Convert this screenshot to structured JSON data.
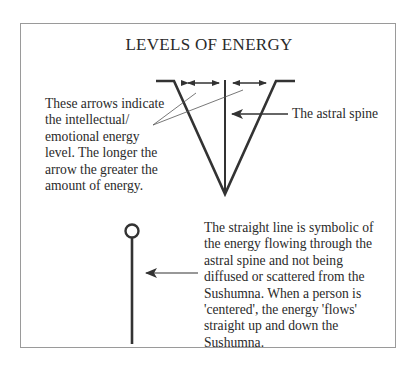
{
  "title": "LEVELS OF ENERGY",
  "annotations": {
    "arrows_note": [
      "These arrows indicate",
      "the intellectual/",
      "emotional energy",
      "level. The longer the",
      "arrow the greater the",
      "amount of energy."
    ],
    "spine_label": "The astral spine",
    "straight_line_note": [
      "The straight line is symbolic of",
      "the energy flowing through the",
      "astral spine and not being",
      "diffused or scattered from the",
      "Sushumna. When a person is",
      "'centered', the energy 'flows'",
      "straight up and down the",
      "Sushumna."
    ]
  },
  "colors": {
    "line": "#333333",
    "border": "#9a9a9a",
    "text": "#2a2a2a"
  }
}
